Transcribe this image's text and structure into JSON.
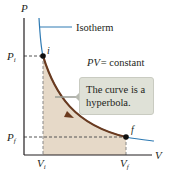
{
  "diagram": {
    "axes": {
      "y_label": "P",
      "x_label": "V"
    },
    "ticks": {
      "P_i": {
        "base": "P",
        "sub": "i"
      },
      "P_f": {
        "base": "P",
        "sub": "f"
      },
      "V_i": {
        "base": "V",
        "sub": "i"
      },
      "V_f": {
        "base": "V",
        "sub": "f"
      }
    },
    "points": {
      "initial": "i",
      "final": "f"
    },
    "isotherm_label": "Isotherm",
    "equation": {
      "lhs": "PV",
      "rhs": "= constant"
    },
    "callout": {
      "line1": "The curve is a",
      "line2": "hyperbola."
    },
    "colors": {
      "isotherm": "#2e7ab3",
      "process_curve": "#6b3a1e",
      "shaded_area": "#e6d9c8",
      "callout_bg": "#dfe1d7",
      "axis": "#231f20"
    }
  }
}
